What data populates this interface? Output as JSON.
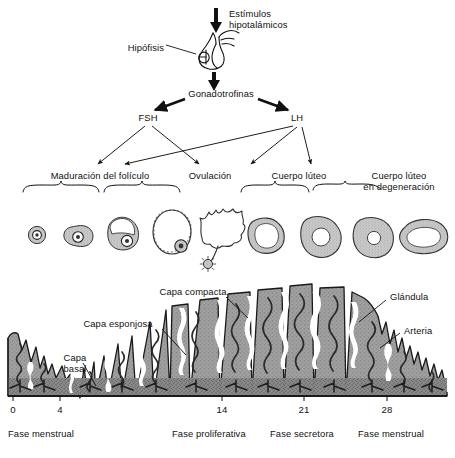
{
  "figure": {
    "language": "es"
  },
  "hypothalamus": {
    "stimulus_label": "Estímulos\nhipotalámicos",
    "pituitary_label": "Hipófisis",
    "gonadotropins_label": "Gonadotrofinas"
  },
  "hormones": {
    "fsh": "FSH",
    "lh": "LH"
  },
  "ovary_stages": [
    {
      "label": "Maduración del folículo"
    },
    {
      "label": "Ovulación"
    },
    {
      "label": "Cuerpo lúteo"
    },
    {
      "label": "Cuerpo lúteo\nen degeneración"
    }
  ],
  "endometrium": {
    "labels": [
      {
        "name": "capa-compacta",
        "text": "Capa compacta"
      },
      {
        "name": "capa-esponjosa",
        "text": "Capa esponjosa"
      },
      {
        "name": "capa-basal",
        "text": "Capa\nbasal"
      },
      {
        "name": "glandula",
        "text": "Glándula"
      },
      {
        "name": "arteria",
        "text": "Arteria"
      }
    ]
  },
  "axis": {
    "day_ticks": [
      "0",
      "4",
      "14",
      "21",
      "28"
    ],
    "phases": [
      {
        "text": "Fase menstrual"
      },
      {
        "text": "Fase proliferativa"
      },
      {
        "text": "Fase secretora"
      },
      {
        "text": "Fase menstrual"
      }
    ]
  },
  "colors": {
    "ink": "#111111",
    "tissue_fill": "#9a9a9a",
    "tissue_dark": "#6e6e6e",
    "background": "#ffffff"
  }
}
